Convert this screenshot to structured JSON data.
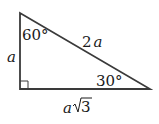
{
  "diagram": {
    "type": "right-triangle",
    "vertices": {
      "top": [
        20,
        13
      ],
      "right_angle": [
        20,
        89
      ],
      "right": [
        150,
        89
      ]
    },
    "labels": {
      "angle_top": "60°",
      "angle_right": "30°",
      "side_vertical": "a",
      "hypotenuse_coef": "2",
      "hypotenuse_var": "a",
      "base_var": "a",
      "base_root": "3"
    },
    "colors": {
      "stroke": "#3a3a3a",
      "text": "#1a1a1a",
      "background": "#ffffff"
    }
  }
}
